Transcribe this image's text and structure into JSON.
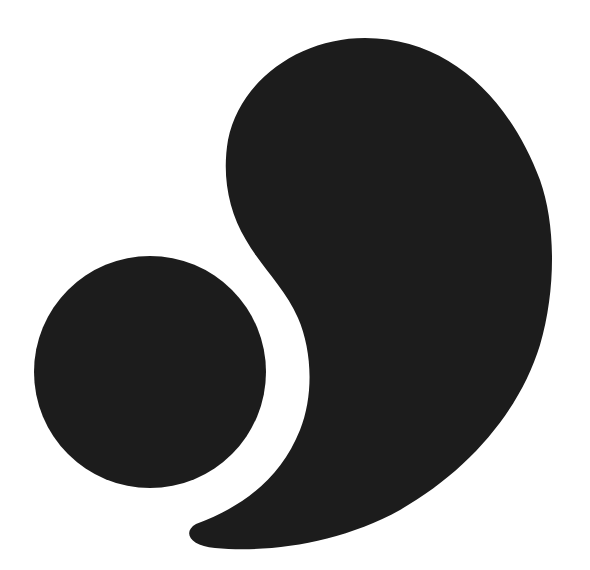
{
  "graphic": {
    "title": "Circle and comma logo mark",
    "background_color": "#ffffff",
    "fill_color": "#1c1c1c",
    "shapes": [
      {
        "name": "circle",
        "cx": 150,
        "cy": 372,
        "r": 116
      },
      {
        "name": "comma",
        "description": "Large comma / teardrop shape curving around the circle"
      }
    ]
  }
}
